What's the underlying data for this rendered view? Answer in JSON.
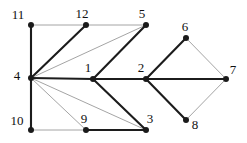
{
  "figure": {
    "name": "undirected-graph-diagram",
    "width": 247,
    "height": 143,
    "background": "#ffffff"
  },
  "style": {
    "node_color": "#1a1a1a",
    "node_radius": 3,
    "edge_dark_color": "#1c1c1c",
    "edge_light_color": "#9a9a9a",
    "edge_dark_width": 2.1,
    "edge_medium_width": 1.5,
    "edge_light_width": 0.9,
    "label_color": "#101010"
  },
  "chart_data": {
    "type": "diagram",
    "title": "",
    "nodes": [
      {
        "id": "11",
        "label": "11",
        "x": 31,
        "y": 25,
        "label_x": 18,
        "label_y": 14
      },
      {
        "id": "12",
        "label": "12",
        "x": 86,
        "y": 25,
        "label_x": 82,
        "label_y": 13
      },
      {
        "id": "5",
        "label": "5",
        "x": 146,
        "y": 25,
        "label_x": 142,
        "label_y": 13
      },
      {
        "id": "6",
        "label": "6",
        "x": 186,
        "y": 38,
        "label_x": 185,
        "label_y": 26
      },
      {
        "id": "4",
        "label": "4",
        "x": 31,
        "y": 78,
        "label_x": 17,
        "label_y": 75
      },
      {
        "id": "1",
        "label": "1",
        "x": 93,
        "y": 79,
        "label_x": 88,
        "label_y": 67
      },
      {
        "id": "2",
        "label": "2",
        "x": 146,
        "y": 79,
        "label_x": 141,
        "label_y": 67
      },
      {
        "id": "7",
        "label": "7",
        "x": 226,
        "y": 79,
        "label_x": 233,
        "label_y": 69
      },
      {
        "id": "8",
        "label": "8",
        "x": 186,
        "y": 120,
        "label_x": 195,
        "label_y": 124
      },
      {
        "id": "3",
        "label": "3",
        "x": 146,
        "y": 130,
        "label_x": 150,
        "label_y": 118
      },
      {
        "id": "9",
        "label": "9",
        "x": 86,
        "y": 130,
        "label_x": 84,
        "label_y": 118
      },
      {
        "id": "10",
        "label": "10",
        "x": 31,
        "y": 130,
        "label_x": 17,
        "label_y": 120
      }
    ],
    "edges": [
      {
        "from": "11",
        "to": "12",
        "weight": "light"
      },
      {
        "from": "12",
        "to": "5",
        "weight": "light"
      },
      {
        "from": "11",
        "to": "4",
        "weight": "dark"
      },
      {
        "from": "12",
        "to": "4",
        "weight": "dark"
      },
      {
        "from": "5",
        "to": "4",
        "weight": "light"
      },
      {
        "from": "4",
        "to": "1",
        "weight": "dark"
      },
      {
        "from": "4",
        "to": "10",
        "weight": "dark"
      },
      {
        "from": "4",
        "to": "9",
        "weight": "light"
      },
      {
        "from": "4",
        "to": "3",
        "weight": "light"
      },
      {
        "from": "10",
        "to": "9",
        "weight": "light"
      },
      {
        "from": "9",
        "to": "3",
        "weight": "dark"
      },
      {
        "from": "1",
        "to": "5",
        "weight": "dark"
      },
      {
        "from": "1",
        "to": "3",
        "weight": "dark"
      },
      {
        "from": "1",
        "to": "2",
        "weight": "dark"
      },
      {
        "from": "2",
        "to": "6",
        "weight": "dark"
      },
      {
        "from": "2",
        "to": "8",
        "weight": "dark"
      },
      {
        "from": "2",
        "to": "7",
        "weight": "dark"
      },
      {
        "from": "6",
        "to": "7",
        "weight": "light"
      },
      {
        "from": "8",
        "to": "7",
        "weight": "light"
      }
    ]
  }
}
